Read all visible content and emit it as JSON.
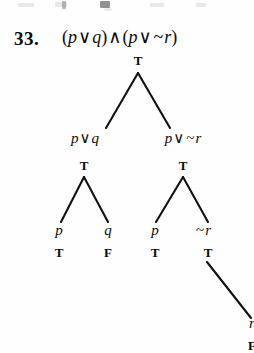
{
  "exercise": {
    "number": "33.",
    "formula_parts": {
      "open1": "(",
      "p1": "p",
      "or1": "∨",
      "q1": "q",
      "close1": ")",
      "and": "∧",
      "open2": "(",
      "p2": "p",
      "or2": "∨",
      "not": "~",
      "r1": "r",
      "close2": ")"
    },
    "formula_text": "(p ∨ q) ∧ (p ∨ ~ r)"
  },
  "tree": {
    "type": "truth-tree",
    "root": {
      "label": "(p ∨ q) ∧ (p ∨ ~ r)",
      "value": "T"
    },
    "level2": [
      {
        "id": "left",
        "formula": "p ∨ q",
        "value": "T"
      },
      {
        "id": "right",
        "formula": "p ∨ ~ r",
        "value": "T"
      }
    ],
    "level3": [
      {
        "id": "l-left",
        "formula": "p",
        "value": "T"
      },
      {
        "id": "l-right",
        "formula": "q",
        "value": "F"
      },
      {
        "id": "r-left",
        "formula": "p",
        "value": "T"
      },
      {
        "id": "r-right",
        "formula": "~ r",
        "value": "T"
      }
    ],
    "level4": [
      {
        "id": "rr-child",
        "formula": "r",
        "value": "F",
        "clipped": true
      }
    ],
    "labels": {
      "root_value": "T",
      "left_branch_formula_p": "p",
      "left_branch_or": "∨",
      "left_branch_formula_q": "q",
      "left_branch_value": "T",
      "right_branch_formula_p": "p",
      "right_branch_or": "∨",
      "right_branch_not": "~",
      "right_branch_formula_r": "r",
      "right_branch_value": "T",
      "leaf1_formula": "p",
      "leaf1_value": "T",
      "leaf2_formula": "q",
      "leaf2_value": "F",
      "leaf3_formula": "p",
      "leaf3_value": "T",
      "leaf4_not": "~",
      "leaf4_formula": "r",
      "leaf4_value": "T",
      "leaf5_formula": "r",
      "leaf5_value": "F"
    }
  },
  "colors": {
    "ink": "#0b0b0b",
    "paper": "#fefefe",
    "line": "#111111"
  }
}
